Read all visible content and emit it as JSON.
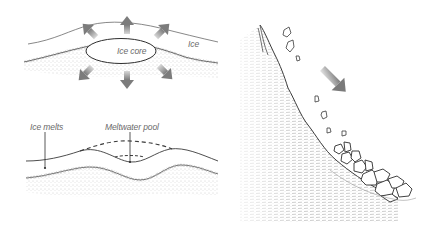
{
  "diagram": {
    "panels": [
      {
        "id": "ice-core-panel",
        "description": "Buried ice core in sediment melting outward",
        "labels": {
          "ice": "Ice",
          "ice_core": "Ice core"
        },
        "arrows": {
          "count": 6,
          "directions": [
            "up-left",
            "up",
            "up-right",
            "down-left",
            "down",
            "down-right"
          ],
          "color": "#8c8c8c"
        }
      },
      {
        "id": "meltwater-panel",
        "description": "Ice melts leaving a depression with a meltwater pool; dashed line shows former surface",
        "labels": {
          "ice_melts": "Ice melts",
          "meltwater_pool": "Meltwater pool"
        }
      },
      {
        "id": "rockfall-panel",
        "description": "Steep slope with rocks falling and accumulating as talus at the base",
        "arrows": {
          "count": 1,
          "directions": [
            "down-right"
          ],
          "color": "#8c8c8c"
        }
      }
    ],
    "colors": {
      "line": "#3a3a3a",
      "stipple": "#9a9a9a",
      "arrow": "#8c8c8c",
      "label": "#6a6a6a",
      "background": "#ffffff"
    }
  }
}
